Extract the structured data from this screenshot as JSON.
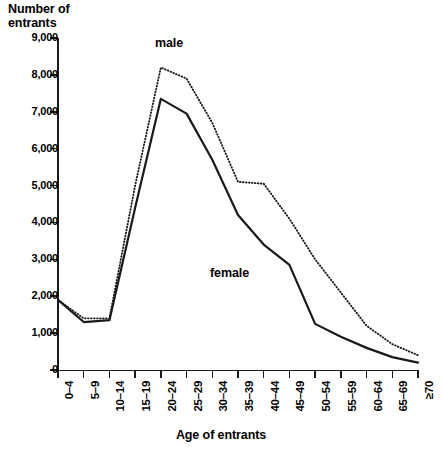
{
  "chart_data": {
    "type": "line",
    "title": "",
    "ylabel": "Number of\nentrants",
    "xlabel": "Age of entrants",
    "ylim": [
      0,
      9000
    ],
    "ytick_values": [
      0,
      1000,
      2000,
      3000,
      4000,
      5000,
      6000,
      7000,
      8000,
      9000
    ],
    "ytick_labels": [
      "0",
      "1,000",
      "2,000",
      "3,000",
      "4,000",
      "5,000",
      "6,000",
      "7,000",
      "8,000",
      "9,000"
    ],
    "categories": [
      "0–4",
      "5–9",
      "10–14",
      "15–19",
      "20–24",
      "25–29",
      "30–34",
      "35–39",
      "40–44",
      "45–49",
      "50–54",
      "55–59",
      "60–64",
      "65–69",
      "≥70"
    ],
    "grid": false,
    "legend_position": "inline-annotation",
    "series": [
      {
        "name": "male",
        "style": "dotted",
        "color": "#1a1a1a",
        "values": [
          1900,
          1400,
          1400,
          5000,
          8200,
          7900,
          6700,
          5100,
          5050,
          4100,
          3000,
          2100,
          1200,
          700,
          400
        ]
      },
      {
        "name": "female",
        "style": "solid",
        "color": "#1a1a1a",
        "values": [
          1900,
          1300,
          1350,
          4400,
          7350,
          6950,
          5700,
          4200,
          3400,
          2850,
          1250,
          900,
          600,
          350,
          200
        ]
      }
    ],
    "annotations": [
      {
        "text": "male",
        "series": "male"
      },
      {
        "text": "female",
        "series": "female"
      }
    ]
  },
  "axis": {
    "y_title": "Number of\nentrants",
    "x_title": "Age of entrants"
  }
}
